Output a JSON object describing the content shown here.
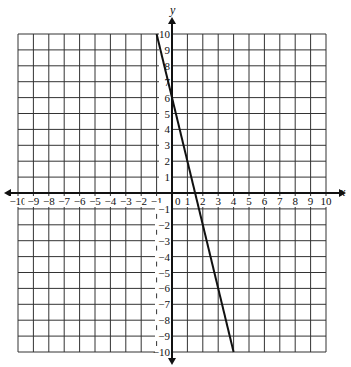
{
  "chart_data": {
    "type": "line",
    "title": "",
    "xlabel": "x",
    "ylabel": "y",
    "xlim": [
      -10,
      10
    ],
    "ylim": [
      -10,
      10
    ],
    "grid": true,
    "x_ticks": [
      -10,
      -9,
      -8,
      -7,
      -6,
      -5,
      -4,
      -3,
      -2,
      -1,
      0,
      1,
      2,
      3,
      4,
      5,
      6,
      7,
      8,
      9,
      10
    ],
    "y_ticks": [
      -10,
      -9,
      -8,
      -7,
      -6,
      -5,
      -4,
      -3,
      -2,
      -1,
      1,
      2,
      3,
      4,
      5,
      6,
      7,
      8,
      9,
      10
    ],
    "series": [
      {
        "name": "y = -4x + 6",
        "x": [
          -1,
          4
        ],
        "y": [
          10,
          -10
        ]
      }
    ],
    "colors": {
      "grid": "#333333",
      "line": "#111111",
      "axis": "#111111"
    }
  }
}
